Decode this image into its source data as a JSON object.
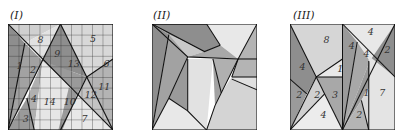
{
  "panels": [
    {
      "title": "(I)",
      "labels": [
        {
          "text": "1",
          "x": 8,
          "y": 42
        },
        {
          "text": "2",
          "x": 21,
          "y": 46
        },
        {
          "text": "3",
          "x": 14,
          "y": 92
        },
        {
          "text": "4",
          "x": 22,
          "y": 74
        },
        {
          "text": "5",
          "x": 78,
          "y": 17
        },
        {
          "text": "6",
          "x": 91,
          "y": 41
        },
        {
          "text": "7",
          "x": 70,
          "y": 92
        },
        {
          "text": "8",
          "x": 28,
          "y": 18
        },
        {
          "text": "9",
          "x": 44,
          "y": 31
        },
        {
          "text": "10",
          "x": 53,
          "y": 76
        },
        {
          "text": "11",
          "x": 86,
          "y": 62
        },
        {
          "text": "12",
          "x": 73,
          "y": 70
        },
        {
          "text": "13",
          "x": 57,
          "y": 41
        },
        {
          "text": "14",
          "x": 34,
          "y": 76
        }
      ]
    },
    {
      "title": "(II)",
      "labels": []
    },
    {
      "title": "(III)",
      "labels": [
        {
          "text": "8",
          "x": 32,
          "y": 18
        },
        {
          "text": "4",
          "x": 9,
          "y": 43
        },
        {
          "text": "1",
          "x": 45,
          "y": 45
        },
        {
          "text": "2",
          "x": 6,
          "y": 70
        },
        {
          "text": "2",
          "x": 23,
          "y": 70
        },
        {
          "text": "3",
          "x": 40,
          "y": 70
        },
        {
          "text": "4",
          "x": 29,
          "y": 89
        },
        {
          "text": "4",
          "x": 74,
          "y": 10
        },
        {
          "text": "4",
          "x": 56,
          "y": 24
        },
        {
          "text": "4",
          "x": 70,
          "y": 31
        },
        {
          "text": "2",
          "x": 90,
          "y": 27
        },
        {
          "text": "1",
          "x": 70,
          "y": 68
        },
        {
          "text": "7",
          "x": 85,
          "y": 68
        },
        {
          "text": "2",
          "x": 63,
          "y": 89
        }
      ]
    }
  ],
  "colors": {
    "dark": "#8e8e8e",
    "mid": "#b4b4b4",
    "light": "#d6d6d6",
    "pale": "#ececec",
    "line": "#1a1a1a"
  }
}
